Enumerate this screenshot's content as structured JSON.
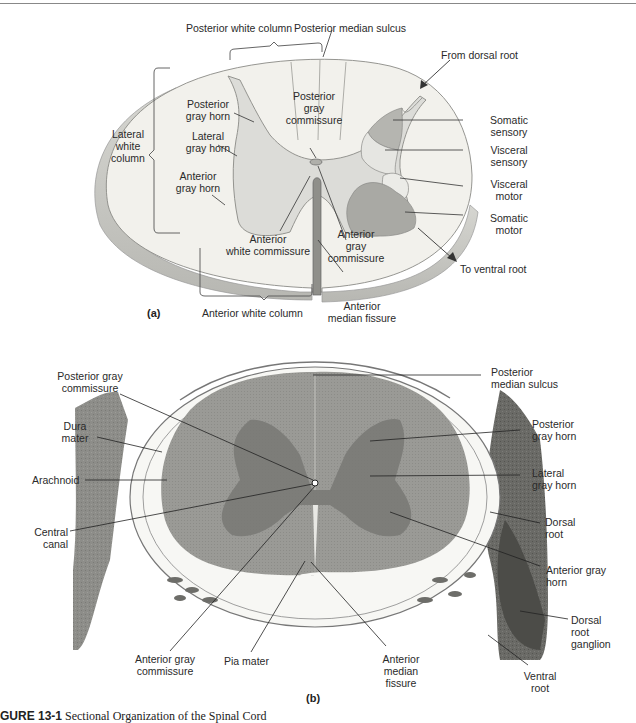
{
  "figure": {
    "caption_prefix": "GURE 13-1",
    "caption_title": "Sectional Organization of the Spinal Cord",
    "colors": {
      "white_matter": "#f2f1ec",
      "gray_matter": "#dcdcd8",
      "somatic_sensory": "#b5b5b0",
      "visceral": "#e6e6e2",
      "somatic_motor": "#a9a9a4",
      "rim": "#c4c4bf",
      "photo_tissue": "#8a8a86",
      "photo_gray": "#6e6e6a"
    }
  },
  "panel_a": {
    "tag": "(a)",
    "labels": {
      "posterior_white_column": "Posterior white column",
      "posterior_median_sulcus": "Posterior median sulcus",
      "from_dorsal_root": "From dorsal root",
      "posterior_gray_horn_1": "Posterior",
      "posterior_gray_horn_2": "gray horn",
      "posterior_gray_commissure_1": "Posterior",
      "posterior_gray_commissure_2": "gray",
      "posterior_gray_commissure_3": "commissure",
      "lateral_white_column_1": "Lateral",
      "lateral_white_column_2": "white",
      "lateral_white_column_3": "column",
      "lateral_gray_horn_1": "Lateral",
      "lateral_gray_horn_2": "gray horn",
      "anterior_gray_horn_1": "Anterior",
      "anterior_gray_horn_2": "gray horn",
      "somatic_sensory_1": "Somatic",
      "somatic_sensory_2": "sensory",
      "visceral_sensory_1": "Visceral",
      "visceral_sensory_2": "sensory",
      "visceral_motor_1": "Visceral",
      "visceral_motor_2": "motor",
      "somatic_motor_1": "Somatic",
      "somatic_motor_2": "motor",
      "anterior_white_commissure_1": "Anterior",
      "anterior_white_commissure_2": "white commissure",
      "anterior_gray_commissure_1": "Anterior",
      "anterior_gray_commissure_2": "gray",
      "anterior_gray_commissure_3": "commissure",
      "to_ventral_root": "To ventral root",
      "anterior_white_column": "Anterior white column",
      "anterior_median_fissure_1": "Anterior",
      "anterior_median_fissure_2": "median fissure"
    }
  },
  "panel_b": {
    "tag": "(b)",
    "labels": {
      "posterior_gray_commissure_1": "Posterior gray",
      "posterior_gray_commissure_2": "commissure",
      "dura_mater_1": "Dura",
      "dura_mater_2": "mater",
      "arachnoid": "Arachnoid",
      "central_canal_1": "Central",
      "central_canal_2": "canal",
      "anterior_gray_commissure_1": "Anterior gray",
      "anterior_gray_commissure_2": "commissure",
      "pia_mater": "Pia mater",
      "anterior_median_fissure_1": "Anterior",
      "anterior_median_fissure_2": "median",
      "anterior_median_fissure_3": "fissure",
      "posterior_median_sulcus_1": "Posterior",
      "posterior_median_sulcus_2": "median sulcus",
      "posterior_gray_horn_1": "Posterior",
      "posterior_gray_horn_2": "gray horn",
      "lateral_gray_horn_1": "Lateral",
      "lateral_gray_horn_2": "gray horn",
      "dorsal_root_1": "Dorsal",
      "dorsal_root_2": "root",
      "anterior_gray_horn_1": "Anterior gray",
      "anterior_gray_horn_2": "horn",
      "dorsal_root_ganglion_1": "Dorsal",
      "dorsal_root_ganglion_2": "root",
      "dorsal_root_ganglion_3": "ganglion",
      "ventral_root_1": "Ventral",
      "ventral_root_2": "root"
    }
  }
}
